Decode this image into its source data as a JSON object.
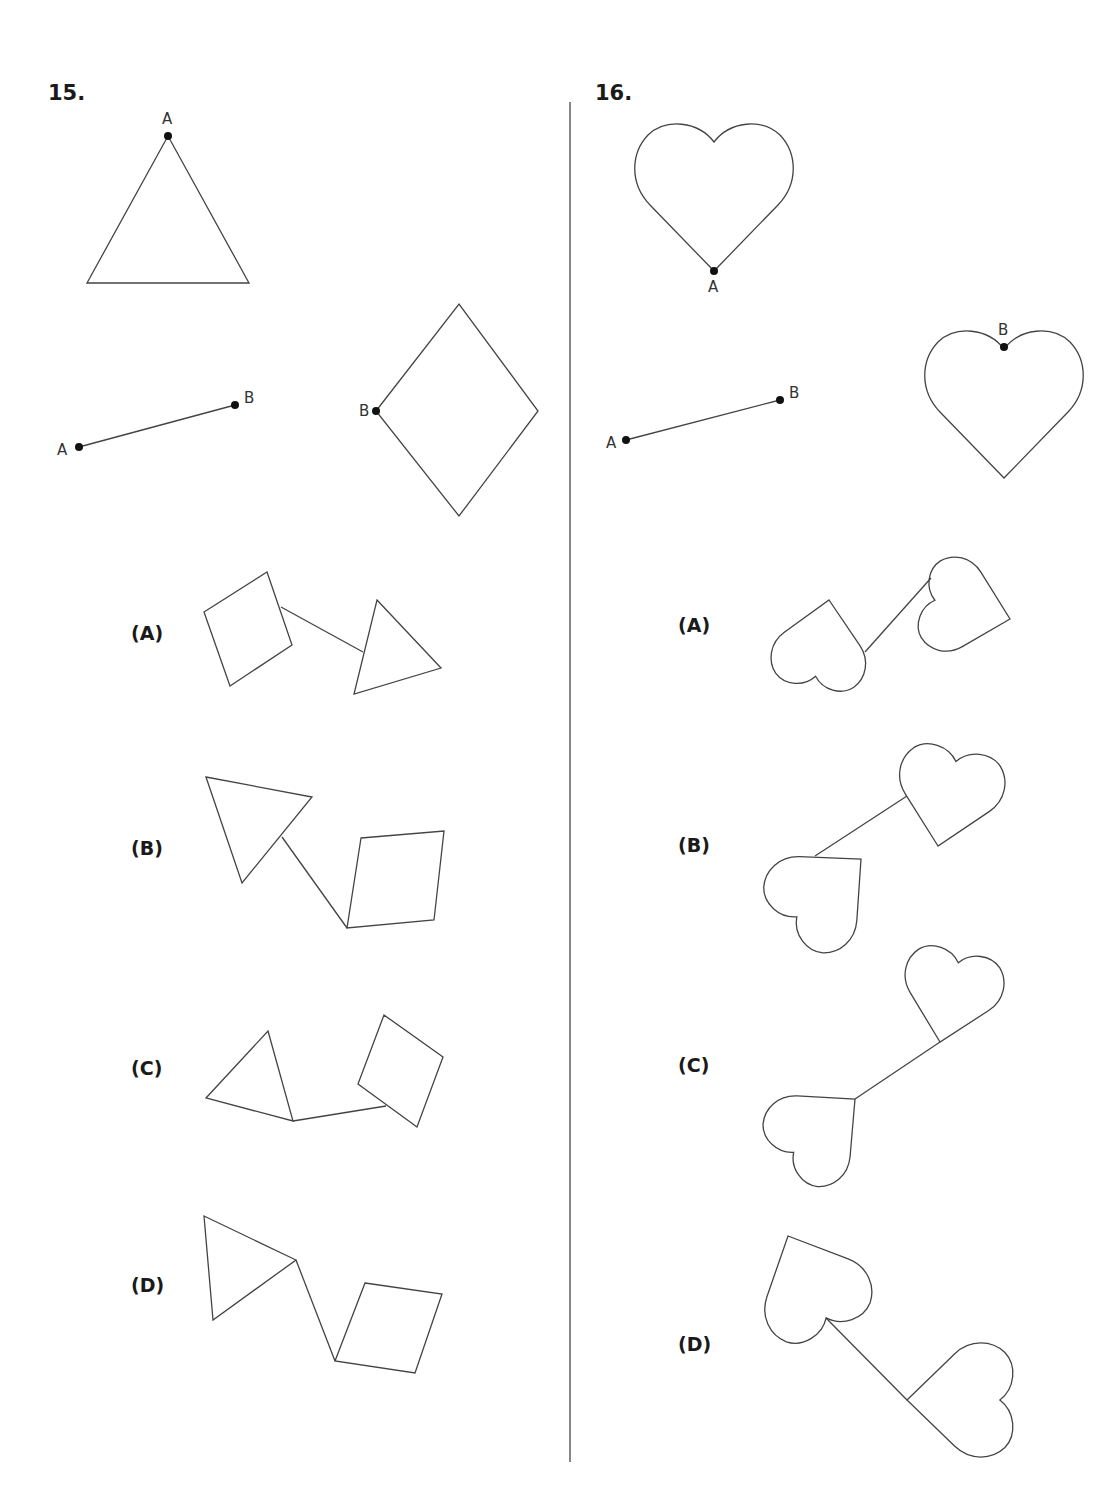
{
  "questions": [
    {
      "number": "15.",
      "number_pos": [
        48,
        100
      ],
      "given": {
        "triangle": {
          "points": [
            [
              168,
              136
            ],
            [
              87,
              283
            ],
            [
              249,
              283
            ]
          ],
          "label": "A",
          "label_pos": [
            162,
            124
          ],
          "dot": [
            168,
            136
          ]
        },
        "segment": {
          "from": [
            79,
            447
          ],
          "to": [
            235,
            405
          ],
          "label_a": "A",
          "label_a_pos": [
            57,
            455
          ],
          "label_b": "B",
          "label_b_pos": [
            244,
            403
          ]
        },
        "rhombus": {
          "points": [
            [
              376,
              411
            ],
            [
              459,
              304
            ],
            [
              538,
              411
            ],
            [
              459,
              516
            ]
          ],
          "label": "B",
          "label_pos": [
            359,
            416
          ],
          "dot": [
            376,
            411
          ]
        }
      },
      "options": [
        {
          "label": "(A)",
          "label_pos": [
            131,
            640
          ],
          "polygons": [
            [
              [
                204,
                612
              ],
              [
                267,
                572
              ],
              [
                292,
                645
              ],
              [
                230,
                686
              ]
            ],
            [
              [
                377,
                600
              ],
              [
                441,
                668
              ],
              [
                354,
                694
              ]
            ]
          ],
          "line": [
            [
              281,
              607
            ],
            [
              363,
              652
            ]
          ]
        },
        {
          "label": "(B)",
          "label_pos": [
            131,
            855
          ],
          "polygons": [
            [
              [
                206,
                777
              ],
              [
                312,
                797
              ],
              [
                242,
                883
              ]
            ],
            [
              [
                361,
                838
              ],
              [
                444,
                831
              ],
              [
                434,
                920
              ],
              [
                347,
                928
              ]
            ]
          ],
          "line": [
            [
              282,
              837
            ],
            [
              347,
              928
            ]
          ]
        },
        {
          "label": "(C)",
          "label_pos": [
            131,
            1075
          ],
          "polygons": [
            [
              [
                268,
                1031
              ],
              [
                293,
                1121
              ],
              [
                206,
                1098
              ]
            ],
            [
              [
                384,
                1015
              ],
              [
                443,
                1057
              ],
              [
                417,
                1127
              ],
              [
                358,
                1084
              ]
            ]
          ],
          "line": [
            [
              293,
              1121
            ],
            [
              386,
              1106
            ]
          ]
        },
        {
          "label": "(D)",
          "label_pos": [
            131,
            1292
          ],
          "polygons": [
            [
              [
                204,
                1216
              ],
              [
                296,
                1260
              ],
              [
                213,
                1320
              ]
            ],
            [
              [
                365,
                1283
              ],
              [
                442,
                1294
              ],
              [
                415,
                1373
              ],
              [
                335,
                1361
              ]
            ]
          ],
          "line": [
            [
              296,
              1260
            ],
            [
              335,
              1361
            ]
          ]
        }
      ]
    },
    {
      "number": "16.",
      "number_pos": [
        595,
        100
      ],
      "given": {
        "heart_a": {
          "tip": [
            714,
            271
          ],
          "rotate": 0,
          "scale": 1,
          "label": "A",
          "label_pos": [
            708,
            292
          ],
          "dot": [
            714,
            271
          ]
        },
        "segment": {
          "from": [
            626,
            440
          ],
          "to": [
            780,
            400
          ],
          "label_a": "A",
          "label_a_pos": [
            606,
            448
          ],
          "label_b": "B",
          "label_b_pos": [
            789,
            398
          ]
        },
        "heart_b": {
          "tip": [
            1004,
            478
          ],
          "rotate": 0,
          "scale": 1,
          "label": "B",
          "label_pos": [
            998,
            335
          ],
          "dot": [
            1004,
            347
          ]
        }
      },
      "options": [
        {
          "label": "(A)",
          "label_pos": [
            678,
            632
          ],
          "hearts": [
            {
              "tip": [
                829,
                600
              ],
              "rotate": 190,
              "scale": 0.6
            },
            {
              "tip": [
                1010,
                619
              ],
              "rotate": -76,
              "scale": 0.6
            }
          ],
          "line": [
            [
              865,
              652
            ],
            [
              931,
              578
            ]
          ]
        },
        {
          "label": "(B)",
          "label_pos": [
            678,
            852
          ],
          "hearts": [
            {
              "tip": [
                938,
                846
              ],
              "rotate": 12,
              "scale": 0.67
            },
            {
              "tip": [
                861,
                859
              ],
              "rotate": 228,
              "scale": 0.67
            }
          ],
          "line": [
            [
              907,
              796
            ],
            [
              815,
              856
            ]
          ]
        },
        {
          "label": "(C)",
          "label_pos": [
            678,
            1072
          ],
          "hearts": [
            {
              "tip": [
                940,
                1042
              ],
              "rotate": 13,
              "scale": 0.63
            },
            {
              "tip": [
                855,
                1099
              ],
              "rotate": 229,
              "scale": 0.63
            }
          ],
          "line": [
            [
              940,
              1042
            ],
            [
              855,
              1099
            ]
          ]
        },
        {
          "label": "(D)",
          "label_pos": [
            678,
            1351
          ],
          "hearts": [
            {
              "tip": [
                788,
                1236
              ],
              "rotate": 155,
              "scale": 0.7
            },
            {
              "tip": [
                907,
                1400
              ],
              "rotate": 90,
              "scale": 0.72
            }
          ],
          "line": [
            [
              826,
              1318
            ],
            [
              907,
              1400
            ]
          ]
        }
      ]
    }
  ],
  "divider": {
    "x": 570,
    "y1": 102,
    "y2": 1462
  }
}
